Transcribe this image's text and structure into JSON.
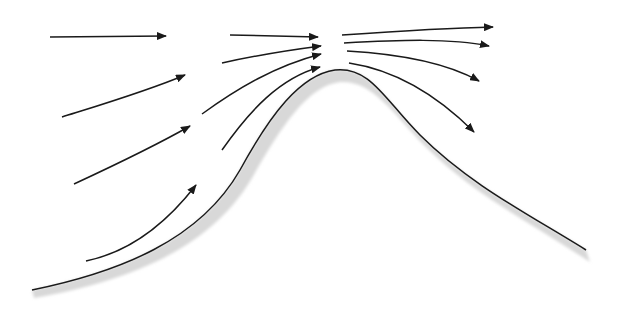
{
  "diagram": {
    "colors": {
      "line": "#1a1a1a",
      "shadow": "#d8d8d8",
      "background": "#ffffff"
    },
    "hill": {
      "path": "M 32 290 C 120 272, 200 240, 240 170 C 270 115, 300 75, 335 70 C 370 66, 385 100, 420 135 C 470 185, 530 215, 586 250",
      "shadow_path": "M 34 298 C 125 282, 210 250, 252 178 C 282 125, 308 86, 340 82 C 372 80, 392 112, 425 146 C 475 196, 535 225, 590 262 L 586 250 C 530 215, 470 185, 420 135 C 385 100, 370 66, 335 70 C 300 75, 270 115, 240 170 C 200 240, 120 272, 32 290 Z"
    },
    "streamlines": [
      {
        "id": "left-1",
        "path": "M 50 37 L 166 36",
        "arrow": true
      },
      {
        "id": "left-2",
        "path": "M 62 117 C 110 102, 150 90, 185 75",
        "arrow": true
      },
      {
        "id": "left-3",
        "path": "M 74 184 C 115 165, 155 146, 190 126",
        "arrow": true
      },
      {
        "id": "left-4",
        "path": "M 86 261 C 130 252, 165 225, 196 185",
        "arrow": true
      },
      {
        "id": "mid-1",
        "path": "M 230 35 L 318 37",
        "arrow": true
      },
      {
        "id": "mid-2",
        "path": "M 222 63 C 258 55, 290 50, 321 46",
        "arrow": true
      },
      {
        "id": "mid-3",
        "path": "M 202 114 C 238 88, 275 66, 321 54",
        "arrow": true
      },
      {
        "id": "mid-4",
        "path": "M 222 150 C 250 110, 280 78, 320 67",
        "arrow": true
      },
      {
        "id": "right-1",
        "path": "M 342 35 C 400 31, 450 28, 493 27",
        "arrow": true
      },
      {
        "id": "right-2",
        "path": "M 344 43 C 400 40, 450 38, 489 46",
        "arrow": true
      },
      {
        "id": "right-3",
        "path": "M 347 51 C 400 54, 445 62, 479 81",
        "arrow": true
      },
      {
        "id": "right-4",
        "path": "M 349 63 C 395 70, 435 93, 474 132",
        "arrow": true
      }
    ]
  }
}
